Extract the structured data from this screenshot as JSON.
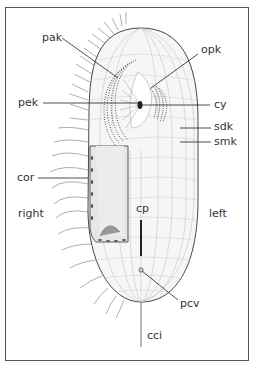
{
  "figure": {
    "type": "ciliate cell diagram",
    "side_labels": {
      "right": "right",
      "left": "left"
    },
    "labels": {
      "pak": "pak",
      "opk": "opk",
      "pek": "pek",
      "cy": "cy",
      "sdk": "sdk",
      "smk": "smk",
      "cor": "cor",
      "cp": "cp",
      "pcv": "pcv",
      "cci": "cci"
    },
    "colors": {
      "line": "#333333",
      "frame": "#555555",
      "fill": "#f4f4f4",
      "cavity": "#e2e2e2"
    }
  }
}
